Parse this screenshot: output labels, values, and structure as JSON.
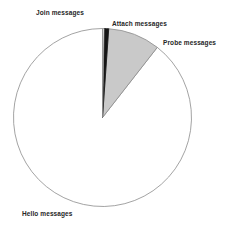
{
  "chart_data": {
    "type": "pie",
    "title": "",
    "categories": [
      "Hello messages",
      "Probe messages",
      "Attach messages",
      "Join messages"
    ],
    "values": [
      89.4,
      9.4,
      0.9,
      0.3
    ],
    "units": "percent",
    "total": 100,
    "start_angle_deg": 0,
    "direction": "clockwise",
    "legend": "none",
    "labels_position": "outside",
    "grid": false,
    "slices": [
      {
        "label": "Hello messages",
        "value": 89.4,
        "color": "#ffffff",
        "stroke": "#8c8c8c",
        "start_deg": 38.0,
        "end_deg": 360.0
      },
      {
        "label": "Probe messages",
        "value": 9.4,
        "color": "#c9c9c9",
        "stroke": "#8c8c8c",
        "start_deg": 4.0,
        "end_deg": 38.0
      },
      {
        "label": "Attach messages",
        "value": 0.9,
        "color": "#151515",
        "stroke": "#151515",
        "start_deg": 1.0,
        "end_deg": 4.0
      },
      {
        "label": "Join messages",
        "value": 0.3,
        "color": "#ffffff",
        "stroke": "#8c8c8c",
        "start_deg": 0.0,
        "end_deg": 1.0
      }
    ],
    "geometry": {
      "center_x": 102.5,
      "center_y": 117.5,
      "radius": 89
    }
  },
  "labels": {
    "join": "Join messages",
    "attach": "Attach messages",
    "probe": "Probe messages",
    "hello": "Hello messages"
  }
}
